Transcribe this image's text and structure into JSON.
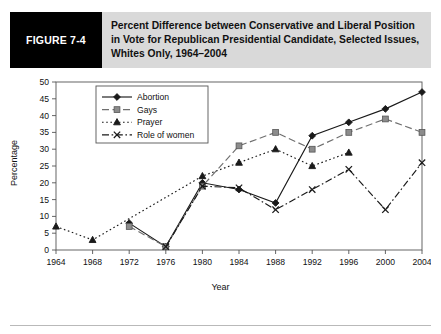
{
  "figure": {
    "tag": "FIGURE 7-4",
    "title": "Percent Difference between Conservative and Liberal Position in Vote for Republican Presidential Candidate, Selected Issues, Whites Only, 1964–2004"
  },
  "chart_data": {
    "type": "line",
    "title": "Percent Difference between Conservative and Liberal Position in Vote for Republican Presidential Candidate, Selected Issues, Whites Only, 1964–2004",
    "xlabel": "Year",
    "ylabel": "Percentage",
    "x": [
      1964,
      1968,
      1972,
      1976,
      1980,
      1984,
      1988,
      1992,
      1996,
      2000,
      2004
    ],
    "xtick_labels": [
      "1964",
      "1968",
      "1972",
      "1976",
      "1980",
      "1984",
      "1988",
      "1992",
      "1996",
      "2000",
      "2004"
    ],
    "ytick_labels": [
      "0",
      "5",
      "10",
      "15",
      "20",
      "25",
      "30",
      "35",
      "40",
      "45",
      "50"
    ],
    "ylim": [
      0,
      50
    ],
    "ytick_step": 5,
    "grid": false,
    "legend_position": "upper-left-inside",
    "series": [
      {
        "name": "Abortion",
        "marker": "diamond",
        "dash": "solid",
        "points": [
          {
            "x": 1972,
            "y": 8
          },
          {
            "x": 1976,
            "y": 1
          },
          {
            "x": 1980,
            "y": 20
          },
          {
            "x": 1984,
            "y": 18
          },
          {
            "x": 1988,
            "y": 14
          },
          {
            "x": 1992,
            "y": 34
          },
          {
            "x": 1996,
            "y": 38
          },
          {
            "x": 2000,
            "y": 42
          },
          {
            "x": 2004,
            "y": 47
          }
        ]
      },
      {
        "name": "Gays",
        "marker": "square",
        "dash": "dashed",
        "points": [
          {
            "x": 1972,
            "y": 7
          },
          {
            "x": 1976,
            "y": 1
          },
          {
            "x": 1980,
            "y": 19
          },
          {
            "x": 1984,
            "y": 31
          },
          {
            "x": 1988,
            "y": 35
          },
          {
            "x": 1992,
            "y": 30
          },
          {
            "x": 1996,
            "y": 35
          },
          {
            "x": 2000,
            "y": 39
          },
          {
            "x": 2004,
            "y": 35
          }
        ]
      },
      {
        "name": "Prayer",
        "marker": "triangle",
        "dash": "dotted",
        "points": [
          {
            "x": 1964,
            "y": 7
          },
          {
            "x": 1968,
            "y": 3
          },
          {
            "x": 1980,
            "y": 22
          },
          {
            "x": 1984,
            "y": 26
          },
          {
            "x": 1988,
            "y": 30
          },
          {
            "x": 1992,
            "y": 25
          },
          {
            "x": 1996,
            "y": 29
          }
        ]
      },
      {
        "name": "Role of women",
        "marker": "cross",
        "dash": "dashdot",
        "points": [
          {
            "x": 1976,
            "y": 1
          },
          {
            "x": 1980,
            "y": 19
          },
          {
            "x": 1984,
            "y": 18.5
          },
          {
            "x": 1988,
            "y": 12
          },
          {
            "x": 1992,
            "y": 18
          },
          {
            "x": 1996,
            "y": 24
          },
          {
            "x": 2000,
            "y": 12
          },
          {
            "x": 2004,
            "y": 26
          }
        ]
      }
    ]
  }
}
